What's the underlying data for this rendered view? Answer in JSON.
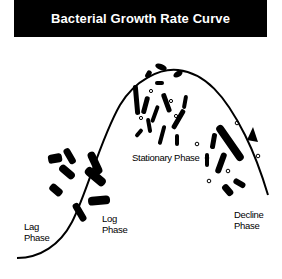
{
  "title": "Bacterial Growth Rate Curve",
  "colors": {
    "title_bg": "#000000",
    "title_fg": "#ffffff",
    "ink": "#000000",
    "background": "#ffffff"
  },
  "phases": [
    {
      "name": "lag",
      "line1": "Lag",
      "line2": "Phase"
    },
    {
      "name": "log",
      "line1": "Log",
      "line2": "Phase"
    },
    {
      "name": "stationary",
      "line1": "Stationary Phase",
      "line2": ""
    },
    {
      "name": "decline",
      "line1": "Decline",
      "line2": "Phase"
    }
  ]
}
